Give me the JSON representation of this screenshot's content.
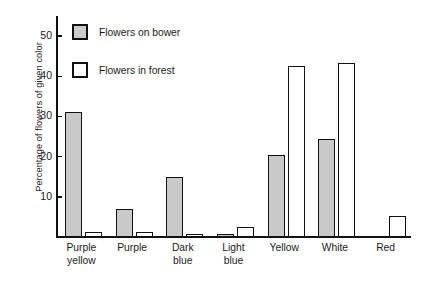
{
  "chart_data": {
    "type": "bar",
    "title": "",
    "xlabel": "",
    "ylabel": "Percentage of flowers of given color",
    "ylim": [
      0,
      55
    ],
    "yticks": [
      10,
      20,
      30,
      40,
      50
    ],
    "ytick_labels": [
      "10",
      "20",
      "30",
      "40",
      "50"
    ],
    "grid": false,
    "legend_position": "top-left",
    "categories": [
      "Purple yellow",
      "Purple",
      "Dark blue",
      "Light blue",
      "Yellow",
      "White",
      "Red"
    ],
    "category_lines": [
      [
        "Purple",
        "yellow"
      ],
      [
        "Purple"
      ],
      [
        "Dark",
        "blue"
      ],
      [
        "Light",
        "blue"
      ],
      [
        "Yellow"
      ],
      [
        "White"
      ],
      [
        "Red"
      ]
    ],
    "series": [
      {
        "name": "Flowers on bower",
        "swatch": "gray",
        "color": "#c9c9c9",
        "values": [
          31.2,
          7.0,
          15.0,
          0.5,
          20.5,
          24.5,
          0
        ]
      },
      {
        "name": "Flowers in forest",
        "swatch": "white",
        "color": "#ffffff",
        "values": [
          1.2,
          1.2,
          0.6,
          2.6,
          42.5,
          43.4,
          5.2
        ]
      }
    ]
  },
  "legend": {
    "items": [
      {
        "label": "Flowers on bower",
        "swatch": "bower"
      },
      {
        "label": "Flowers in forest",
        "swatch": "forest"
      }
    ]
  },
  "axis": {
    "y_title": "Percentage of flowers of given color"
  },
  "colors": {
    "bower_fill": "#c9c9c9",
    "forest_fill": "#ffffff",
    "stroke": "#111111",
    "text": "#1a1a1a",
    "background": "#ffffff"
  }
}
